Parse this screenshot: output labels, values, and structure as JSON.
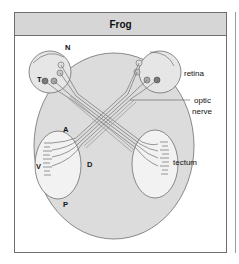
{
  "figure": {
    "title": "Frog",
    "labels": {
      "nasal": "N",
      "temporal": "T",
      "retina": "retina",
      "optic_nerve_line1": "optic",
      "optic_nerve_line2": "nerve",
      "anterior": "A",
      "ventral": "V",
      "dorsal": "D",
      "posterior": "P",
      "tectum": "tectum"
    },
    "colors": {
      "head_fill": "#dcdcdc",
      "title_bar": "#d6d6d6",
      "outline": "#6e6e6e",
      "dark_cell": "#7a7a7a",
      "light_cell": "#d8d8d8"
    }
  }
}
